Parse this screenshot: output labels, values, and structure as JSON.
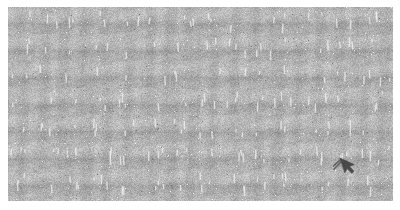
{
  "image": {
    "width": 400,
    "height": 210,
    "background_color": "#ffffff",
    "description": "Heavily degraded, noise-corrupted screenshot; content is illegible"
  },
  "content_region": {
    "name": "degraded-content-region",
    "x": 8,
    "y": 7,
    "width": 385,
    "height": 194,
    "base_color": "#b2b2b2",
    "light_speckle_color": "#f2f2f2",
    "dark_speckle_color": "#6e6e6e",
    "texture": "grid-of-illegible-glyphs",
    "grid_period_x": 27,
    "grid_period_y": 27,
    "estimated_columns": 14,
    "estimated_rows": 7,
    "label": "Unreadable degraded content"
  },
  "cursor": {
    "name": "mouse-pointer",
    "x": 340,
    "y": 158,
    "color": "#3c3c3c",
    "label": "Pointer"
  },
  "margins": {
    "left": 8,
    "top": 7,
    "right": 7,
    "bottom": 9
  }
}
